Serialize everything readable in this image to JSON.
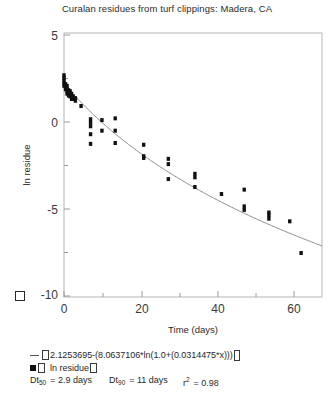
{
  "chart_data": {
    "type": "scatter",
    "title": "Curalan residues from turf clippings: Madera, CA",
    "xlabel": "Time (days)",
    "ylabel": "ln residue",
    "xlim": [
      0,
      68
    ],
    "ylim": [
      -10,
      5
    ],
    "xticks": [
      0,
      20,
      40,
      60
    ],
    "xticklabels": [
      "0",
      "20",
      "40",
      "60"
    ],
    "yticks": [
      -10,
      -5,
      0,
      5
    ],
    "yticklabels": [
      "-10",
      "-5",
      "0",
      "5"
    ],
    "xminorticks": [
      10,
      30,
      50
    ],
    "yminorticks": [
      -7.5,
      -2.5,
      2.5
    ],
    "grid": false,
    "legend_position": "below-axes",
    "series": [
      {
        "name": "ln residue",
        "marker": "filled-square",
        "color": "#111111",
        "points": [
          [
            0,
            2.6
          ],
          [
            0,
            2.45
          ],
          [
            0,
            2.3
          ],
          [
            0,
            2.15
          ],
          [
            0,
            2.0
          ],
          [
            0.4,
            2.1
          ],
          [
            0.4,
            1.95
          ],
          [
            0.4,
            1.8
          ],
          [
            0.8,
            2.0
          ],
          [
            0.8,
            1.85
          ],
          [
            0.8,
            1.7
          ],
          [
            0.8,
            1.55
          ],
          [
            1.2,
            1.75
          ],
          [
            1.2,
            1.6
          ],
          [
            1.2,
            1.45
          ],
          [
            1.6,
            1.7
          ],
          [
            1.6,
            1.55
          ],
          [
            1.6,
            1.4
          ],
          [
            2.0,
            1.55
          ],
          [
            2.0,
            1.4
          ],
          [
            2.0,
            1.25
          ],
          [
            2.4,
            1.4
          ],
          [
            2.4,
            1.25
          ],
          [
            3.0,
            1.3
          ],
          [
            3.0,
            1.15
          ],
          [
            4.5,
            0.85
          ],
          [
            7.0,
            0.1
          ],
          [
            7.0,
            -0.1
          ],
          [
            7.0,
            -0.3
          ],
          [
            7.0,
            -0.75
          ],
          [
            7.0,
            -1.3
          ],
          [
            10.0,
            0.05
          ],
          [
            10.0,
            -0.55
          ],
          [
            13.5,
            0.15
          ],
          [
            13.5,
            -0.55
          ],
          [
            13.5,
            -1.25
          ],
          [
            21.0,
            -1.35
          ],
          [
            21.0,
            -2.0
          ],
          [
            21.0,
            -2.1
          ],
          [
            27.5,
            -2.15
          ],
          [
            27.5,
            -2.45
          ],
          [
            27.5,
            -3.3
          ],
          [
            34.5,
            -3.0
          ],
          [
            34.5,
            -3.2
          ],
          [
            34.5,
            -3.75
          ],
          [
            41.5,
            -4.15
          ],
          [
            47.5,
            -3.9
          ],
          [
            47.5,
            -4.85
          ],
          [
            47.5,
            -5.05
          ],
          [
            54.0,
            -5.2
          ],
          [
            54.0,
            -5.35
          ],
          [
            54.0,
            -5.55
          ],
          [
            59.5,
            -5.7
          ],
          [
            62.5,
            -7.5
          ]
        ]
      }
    ],
    "fit_curve": {
      "name": "fitted model",
      "color": "#8c8c8c",
      "intercept": 2.1253695,
      "coefficient": 8.0637106,
      "rate": 0.0314475,
      "expression": "2.1253695-(8.0637106*ln(1.0+(0.0314475*x)))"
    }
  },
  "title": {
    "text": "Curalan residues from turf clippings: Madera, CA"
  },
  "axes": {
    "x_title": "Time (days)",
    "y_title": "ln residue",
    "x_tick_0": "0",
    "x_tick_1": "20",
    "x_tick_2": "40",
    "x_tick_3": "60",
    "y_tick_0": "5",
    "y_tick_1": "0",
    "y_tick_2": "-5",
    "y_tick_3": "-10"
  },
  "legend": {
    "equation_prefix": "",
    "equation_text": "2.1253695-(8.0637106*ln(1.0+(0.0314475*x)))",
    "series_label": "ln residue",
    "stat_dt50_label": "Dt",
    "stat_dt50_sub": "50",
    "stat_dt50_value": "= 2.9 days",
    "stat_dt90_label": "Dt",
    "stat_dt90_sub": "90",
    "stat_dt90_value": "= 11 days",
    "stat_r2_label": "r",
    "stat_r2_sup": "2",
    "stat_r2_value": "= 0.98"
  },
  "colors": {
    "marker": "#111111",
    "curve": "#8c8c8c",
    "axis": "#9a9a9a",
    "text": "#1f1f1f"
  }
}
